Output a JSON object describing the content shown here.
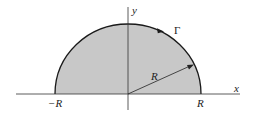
{
  "diagram": {
    "labels": {
      "x_axis": "x",
      "y_axis": "y",
      "contour": "Γ",
      "radius": "R",
      "left_endpoint": "−R",
      "right_endpoint": "R"
    },
    "colors": {
      "fill": "#c8c8c8",
      "stroke": "#1a1a1a",
      "axis": "#333333",
      "background": "#ffffff"
    }
  }
}
